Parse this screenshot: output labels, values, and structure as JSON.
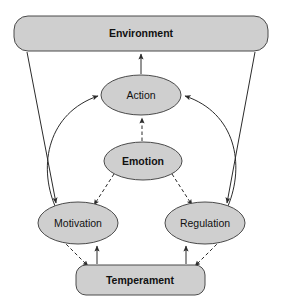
{
  "diagram": {
    "background_color": "#ffffff",
    "node_fill_color": "#cfcfcf",
    "node_stroke_color": "#4a4a4a",
    "edge_color": "#2b2b2b",
    "nodes": [
      {
        "id": "environment",
        "label": "Environment",
        "shape": "rounded-rect",
        "bold": true,
        "x": 14,
        "y": 16,
        "width": 254,
        "height": 35,
        "rx": 14
      },
      {
        "id": "action",
        "label": "Action",
        "shape": "ellipse",
        "bold": false,
        "cx": 141,
        "cy": 95,
        "rx": 40,
        "ry": 20
      },
      {
        "id": "emotion",
        "label": "Emotion",
        "shape": "ellipse",
        "bold": true,
        "cx": 143,
        "cy": 161,
        "rx": 39,
        "ry": 19
      },
      {
        "id": "motivation",
        "label": "Motivation",
        "shape": "ellipse",
        "bold": false,
        "cx": 78,
        "cy": 223,
        "rx": 40,
        "ry": 21
      },
      {
        "id": "regulation",
        "label": "Regulation",
        "shape": "ellipse",
        "bold": false,
        "cx": 205,
        "cy": 223,
        "rx": 40,
        "ry": 21
      },
      {
        "id": "temperament",
        "label": "Temperament",
        "shape": "rounded-rect",
        "bold": true,
        "x": 76,
        "y": 265,
        "width": 129,
        "height": 30,
        "rx": 10
      }
    ],
    "edges": [
      {
        "id": "action-to-environment",
        "from": "action",
        "to": "environment",
        "style": "solid",
        "arrow": "end"
      },
      {
        "id": "environment-to-motivation",
        "from": "environment",
        "to": "motivation",
        "style": "solid",
        "arrow": "end"
      },
      {
        "id": "environment-to-regulation",
        "from": "environment",
        "to": "regulation",
        "style": "solid",
        "arrow": "end"
      },
      {
        "id": "motivation-to-action",
        "from": "motivation",
        "to": "action",
        "style": "solid",
        "arrow": "end"
      },
      {
        "id": "regulation-to-action",
        "from": "regulation",
        "to": "action",
        "style": "solid",
        "arrow": "end"
      },
      {
        "id": "emotion-to-action",
        "from": "emotion",
        "to": "action",
        "style": "dashed",
        "arrow": "end"
      },
      {
        "id": "emotion-to-motivation",
        "from": "emotion",
        "to": "motivation",
        "style": "dashed",
        "arrow": "end"
      },
      {
        "id": "emotion-to-regulation",
        "from": "emotion",
        "to": "regulation",
        "style": "dashed",
        "arrow": "end"
      },
      {
        "id": "motivation-to-temperament",
        "from": "motivation",
        "to": "temperament",
        "style": "dashed",
        "arrow": "end"
      },
      {
        "id": "regulation-to-temperament",
        "from": "regulation",
        "to": "temperament",
        "style": "dashed",
        "arrow": "end"
      },
      {
        "id": "temperament-to-motivation",
        "from": "temperament",
        "to": "motivation",
        "style": "solid",
        "arrow": "end"
      },
      {
        "id": "temperament-to-regulation",
        "from": "temperament",
        "to": "regulation",
        "style": "solid",
        "arrow": "end"
      }
    ]
  }
}
